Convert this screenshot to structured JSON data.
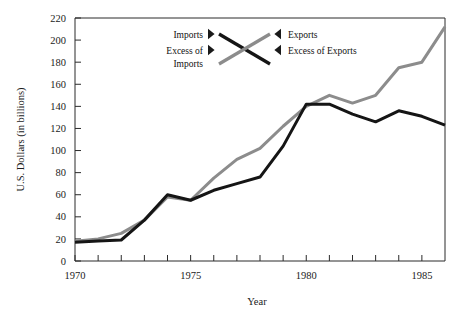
{
  "chart_data": {
    "type": "line",
    "title": "",
    "xlabel": "Year",
    "ylabel": "U.S. Dollars (in billions)",
    "xlim": [
      1970,
      1986
    ],
    "ylim": [
      0,
      220
    ],
    "grid": false,
    "legend_position": "top-center-inside",
    "x": [
      1970,
      1971,
      1972,
      1973,
      1974,
      1975,
      1976,
      1977,
      1978,
      1979,
      1980,
      1981,
      1982,
      1983,
      1984,
      1985,
      1986
    ],
    "y_ticks": [
      0,
      20,
      40,
      60,
      80,
      100,
      120,
      140,
      160,
      180,
      200,
      220
    ],
    "y_tick_labels": [
      "0",
      "20",
      "40",
      "60",
      "80",
      "100",
      "120",
      "140",
      "160",
      "180",
      "200",
      "220"
    ],
    "x_ticks": [
      1970,
      1971,
      1972,
      1973,
      1974,
      1975,
      1976,
      1977,
      1978,
      1979,
      1980,
      1981,
      1982,
      1983,
      1984,
      1985,
      1986
    ],
    "x_tick_labels": [
      "1970",
      "",
      "",
      "",
      "",
      "1975",
      "",
      "",
      "",
      "",
      "1980",
      "",
      "",
      "",
      "",
      "1985",
      ""
    ],
    "x_labeled_ticks": [
      {
        "value": 1970,
        "label": "1970"
      },
      {
        "value": 1975,
        "label": "1975"
      },
      {
        "value": 1980,
        "label": "1980"
      },
      {
        "value": 1985,
        "label": "1985"
      }
    ],
    "series": [
      {
        "name": "Imports",
        "color": "#8c8c8c",
        "values": [
          18,
          20,
          25,
          37,
          58,
          55,
          75,
          92,
          102,
          122,
          140,
          150,
          143,
          150,
          175,
          180,
          212
        ]
      },
      {
        "name": "Exports",
        "color": "#151515",
        "values": [
          17,
          18,
          19,
          37,
          60,
          55,
          64,
          70,
          76,
          104,
          142,
          142,
          133,
          126,
          136,
          131,
          123
        ]
      }
    ]
  },
  "legend": {
    "items": [
      {
        "label": "Imports",
        "side": "left",
        "marker": "pointer-right",
        "series": "Imports",
        "color": "#151515"
      },
      {
        "label": "Excess of Imports",
        "label_line1": "Excess of",
        "label_line2": "Imports",
        "side": "left",
        "marker": "pointer-right",
        "color": "#8c8c8c"
      },
      {
        "label": "Exports",
        "side": "right",
        "marker": "pointer-left",
        "series": "Exports",
        "color": "#8c8c8c"
      },
      {
        "label": "Excess of Exports",
        "side": "right",
        "marker": "pointer-left",
        "color": "#151515"
      }
    ],
    "imports_label": "Imports",
    "excess_of_imports_line1": "Excess of",
    "excess_of_imports_line2": "Imports",
    "exports_label": "Exports",
    "excess_of_exports_label": "Excess of Exports"
  },
  "axes": {
    "y_title": "U.S. Dollars (in billions)",
    "x_title": "Year"
  }
}
